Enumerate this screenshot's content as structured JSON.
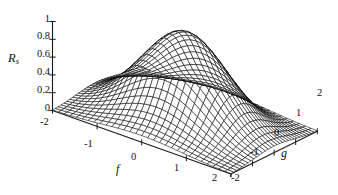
{
  "figure": {
    "kind": "3d-wireframe-surface-plot",
    "background_color": "#ffffff",
    "mesh_color": "#000000",
    "surface_fill_color": "#ffffff"
  },
  "chart_data": {
    "type": "surface",
    "title": "",
    "subtitle": "",
    "xlabel": "f",
    "ylabel": "g",
    "zlabel": "R_s",
    "zlabel_base": "R",
    "zlabel_sub": "s",
    "grid": false,
    "legend": "none",
    "xlim": [
      -2,
      2
    ],
    "ylim": [
      -2,
      2
    ],
    "zlim": [
      0,
      1
    ],
    "x_ticks": [
      -2,
      -1,
      0,
      1,
      2
    ],
    "x_tick_labels": [
      "-2",
      "-1",
      "0",
      "1",
      "2"
    ],
    "y_ticks": [
      -2,
      -1,
      0,
      1,
      2
    ],
    "y_tick_labels": [
      "-2",
      "-1",
      "0",
      "1",
      "2"
    ],
    "z_ticks": [
      0,
      0.2,
      0.4,
      0.6,
      0.8,
      1
    ],
    "z_tick_labels": [
      "0",
      "0.2",
      "0.4",
      "0.6",
      "0.8",
      "1"
    ],
    "peak_value": 1,
    "peak_location": {
      "f": 0,
      "g": 0
    },
    "function": "exp(-(f^2 + g^2)/1.55)",
    "mesh_divisions_f": 30,
    "mesh_divisions_g": 30,
    "view": {
      "azimuth_deg": 40,
      "elevation_deg": 26
    }
  },
  "axes": {
    "z": {
      "name": "R_s",
      "labels": [
        "1",
        "0.8",
        "0.6",
        "0.4",
        "0.2",
        "0"
      ]
    },
    "f": {
      "name": "f",
      "labels": [
        "-2",
        "-1",
        "0",
        "1",
        "2"
      ]
    },
    "g": {
      "name": "g",
      "labels": [
        "-2",
        "-1",
        "0",
        "1",
        "2"
      ]
    }
  }
}
